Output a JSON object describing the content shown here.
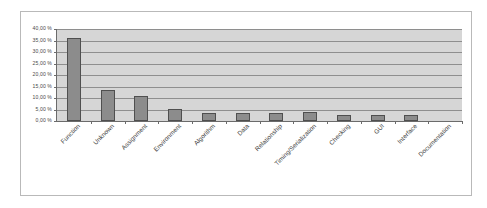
{
  "chart_data": {
    "type": "bar",
    "title": "",
    "subtitle": "",
    "xlabel": "",
    "ylabel": "",
    "grid": true,
    "legend": "none",
    "orientation": "vertical",
    "ylim": [
      0,
      40
    ],
    "ytick_step": 5,
    "ytick_labels": [
      "0,00 %",
      "5,00 %",
      "10,00 %",
      "15,00 %",
      "20,00 %",
      "25,00 %",
      "30,00 %",
      "35,00 %",
      "40,00 %"
    ],
    "ytick_values": [
      0,
      5,
      10,
      15,
      20,
      25,
      30,
      35,
      40
    ],
    "categories": [
      "Function",
      "Unknown",
      "Assignment",
      "Environment",
      "Algorithm",
      "Data",
      "Relationship",
      "Timing/Serialization",
      "Checking",
      "GUI",
      "Interface",
      "Documentation"
    ],
    "values": [
      36.0,
      13.7,
      10.7,
      5.2,
      3.6,
      3.7,
      3.7,
      3.8,
      2.5,
      2.5,
      2.5,
      0.0
    ],
    "units": "%",
    "colors": {
      "bar_fill": "#8c8c8c",
      "bar_stroke": "#4f4f4f",
      "plot_background": "#d6d6d6",
      "gridline": "#8e8e8e",
      "axis": "#6b6b6b",
      "frame_border": "#b9b9b9",
      "page_background": "#ffffff",
      "tick_text": "#4a4a4a",
      "category_text": "#3d3d3d"
    }
  }
}
